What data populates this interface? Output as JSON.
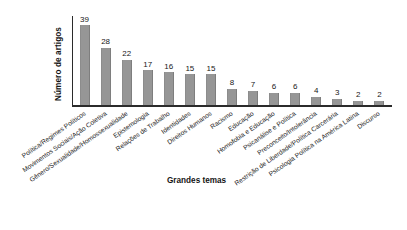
{
  "chart_data": {
    "type": "bar",
    "title": "",
    "xlabel": "Grandes temas",
    "ylabel": "Número de artigos",
    "ylim": [
      0,
      39
    ],
    "grid": false,
    "legend": null,
    "categories": [
      "Política/Regimes Políticos",
      "Movimentos Sociais/Ação Coletiva",
      "Gênero/Sexualidade/Homossexualidade",
      "Epistemologia",
      "Relações de Trabalho",
      "Identidades",
      "Direitos Humanos",
      "Racismo",
      "Educação",
      "Homofobia e Educação",
      "Psicanálise e Política",
      "Preconceito/Intolerância",
      "Restrição de Liberdade/Política Carcerária",
      "Psicologia Política na América Latina",
      "Discurso"
    ],
    "values": [
      39,
      28,
      22,
      17,
      16,
      15,
      15,
      8,
      7,
      6,
      6,
      4,
      3,
      2,
      2
    ],
    "bar_color": "#969696",
    "axis_color": "#2b2b2b",
    "text_color": "#1a1a1a"
  }
}
